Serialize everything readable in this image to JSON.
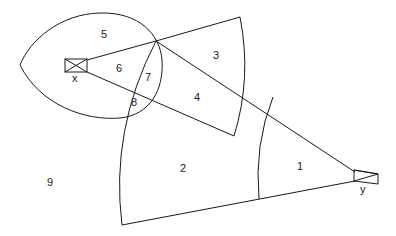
{
  "diagram": {
    "type": "geometric region diagram",
    "nodes": [
      {
        "id": "x",
        "label": "x",
        "shape": "crossed-rectangle"
      },
      {
        "id": "y",
        "label": "y",
        "shape": "crossed-trapezoid"
      }
    ],
    "regions": [
      {
        "id": "1",
        "label": "1"
      },
      {
        "id": "2",
        "label": "2"
      },
      {
        "id": "3",
        "label": "3"
      },
      {
        "id": "4",
        "label": "4"
      },
      {
        "id": "5",
        "label": "5"
      },
      {
        "id": "6",
        "label": "6"
      },
      {
        "id": "7",
        "label": "7"
      },
      {
        "id": "8",
        "label": "8"
      },
      {
        "id": "9",
        "label": "9"
      }
    ],
    "colors": {
      "stroke": "#1a1a1a",
      "background": "#ffffff"
    }
  }
}
